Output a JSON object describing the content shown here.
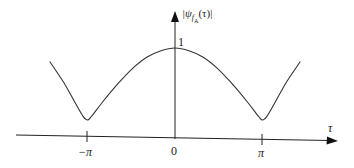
{
  "chart_data": {
    "type": "line",
    "title": "",
    "xlabel": "τ",
    "ylabel": "|ψ_{f_A}(τ)|",
    "ylabel_main": "|ψ",
    "ylabel_sub": "f",
    "ylabel_subsub": "A",
    "ylabel_tail": "(τ)|",
    "x_ticks": [
      {
        "label": "−π",
        "value": -3.14159
      },
      {
        "label": "0",
        "value": 0
      },
      {
        "label": "π",
        "value": 3.14159
      }
    ],
    "y_ticks": [
      {
        "label": "1",
        "value": 1
      }
    ],
    "grid": false,
    "legend": null,
    "series": [
      {
        "name": "|ψ_{f_A}(τ)|",
        "x": [
          -4.5,
          -4.0,
          -3.6,
          -3.3,
          -3.14,
          -3.0,
          -2.6,
          -2.0,
          -1.5,
          -1.0,
          -0.5,
          0,
          0.5,
          1.0,
          1.5,
          2.0,
          2.6,
          3.0,
          3.14,
          3.3,
          3.6,
          4.0,
          4.5
        ],
        "values": [
          0.85,
          0.62,
          0.4,
          0.24,
          0.2,
          0.24,
          0.4,
          0.62,
          0.78,
          0.9,
          0.97,
          1.0,
          0.97,
          0.9,
          0.78,
          0.62,
          0.4,
          0.24,
          0.2,
          0.24,
          0.4,
          0.62,
          0.85
        ]
      }
    ],
    "xlim": [
      -5,
      5
    ],
    "ylim": [
      0,
      1.3
    ]
  }
}
